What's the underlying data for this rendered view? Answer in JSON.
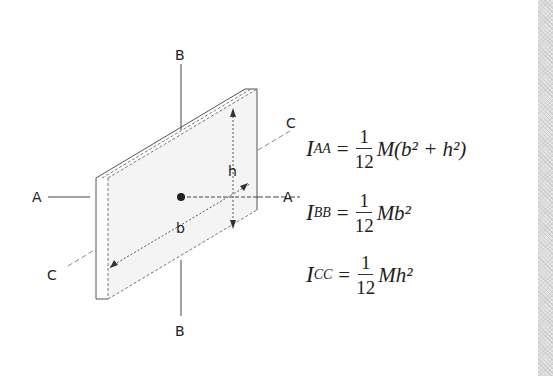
{
  "figure": {
    "axis_labels": {
      "A_left": "A",
      "A_right": "A",
      "B_top": "B",
      "B_bottom": "B",
      "C_upper_right": "C",
      "C_lower_left": "C"
    },
    "dimension_labels": {
      "height": "h",
      "width": "b"
    }
  },
  "equations": [
    {
      "lhs": "I",
      "sub": "AA",
      "equals": "=",
      "num": "1",
      "den": "12",
      "rhs": "M(b² + h²)"
    },
    {
      "lhs": "I",
      "sub": "BB",
      "equals": "=",
      "num": "1",
      "den": "12",
      "rhs": "Mb²"
    },
    {
      "lhs": "I",
      "sub": "CC",
      "equals": "=",
      "num": "1",
      "den": "12",
      "rhs": "Mh²"
    }
  ]
}
